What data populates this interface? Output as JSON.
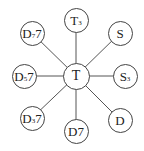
{
  "diagram": {
    "title": "",
    "center": {
      "id": "T",
      "main": "T",
      "sub": "",
      "suffix": "",
      "x": 76,
      "y": 76
    },
    "nodes": [
      {
        "id": "T3",
        "main": "T",
        "sub": "3",
        "suffix": "",
        "x": 76,
        "y": 20
      },
      {
        "id": "S",
        "main": "S",
        "sub": "",
        "suffix": "",
        "x": 120,
        "y": 33
      },
      {
        "id": "S3",
        "main": "S",
        "sub": "3",
        "suffix": "",
        "x": 125,
        "y": 76
      },
      {
        "id": "D",
        "main": "D",
        "sub": "",
        "suffix": "",
        "x": 120,
        "y": 120
      },
      {
        "id": "D7",
        "main": "D",
        "sub": "",
        "suffix": "7",
        "x": 76,
        "y": 131
      },
      {
        "id": "D37",
        "main": "D",
        "sub": "3",
        "suffix": "7",
        "x": 32,
        "y": 118
      },
      {
        "id": "D57",
        "main": "D",
        "sub": "5",
        "suffix": "7",
        "x": 24,
        "y": 76
      },
      {
        "id": "D77",
        "main": "D",
        "sub": "7",
        "suffix": "7",
        "x": 32,
        "y": 33
      }
    ],
    "edge_color": "#555555",
    "node_border_color": "#444444"
  }
}
